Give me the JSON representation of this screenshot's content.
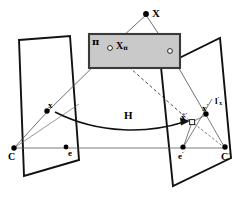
{
  "figure": {
    "background_color": "#ffffff",
    "line_color": "#000000",
    "plane_fill_color": "#c8c8c8",
    "plane_stroke_color": "#333333",
    "width": 239,
    "height": 202
  },
  "labels": {
    "scene_point": "X",
    "plane": "π",
    "plane_point": "X",
    "plane_point_sub": "π",
    "homography": "H",
    "left_image_point": "x",
    "left_camera_center": "C",
    "left_epipole": "e",
    "right_image_point": "x",
    "right_image_point_sup": "′",
    "right_transferred_point": "x̂",
    "right_transferred_point_sup": "′",
    "right_epipolar_line": "l",
    "right_epipolar_line_sup": "′",
    "right_epipolar_line_sub": "x",
    "right_camera_center": "C",
    "right_camera_center_sup": "′",
    "right_epipole": "e",
    "right_epipole_sup": "′"
  },
  "geometry": {
    "points": {
      "X": {
        "x": 146,
        "y": 14,
        "style": "filled"
      },
      "Xpi": {
        "x": 110,
        "y": 48,
        "style": "hollow"
      },
      "Xpi2": {
        "x": 170,
        "y": 51,
        "style": "hollow"
      },
      "x_left": {
        "x": 47,
        "y": 111,
        "style": "filled"
      },
      "C": {
        "x": 14,
        "y": 148,
        "style": "filled"
      },
      "e": {
        "x": 66,
        "y": 148,
        "style": "filled"
      },
      "x_right": {
        "x": 206,
        "y": 114,
        "style": "filled"
      },
      "xhat": {
        "x": 192,
        "y": 122,
        "style": "hollow"
      },
      "e_right": {
        "x": 183,
        "y": 148,
        "style": "filled"
      },
      "C_right": {
        "x": 225,
        "y": 148,
        "style": "filled"
      }
    },
    "left_plane": [
      [
        19,
        40
      ],
      [
        70,
        36
      ],
      [
        79,
        160
      ],
      [
        24,
        176
      ]
    ],
    "right_plane": [
      [
        161,
        67
      ],
      [
        220,
        38
      ],
      [
        230,
        160
      ],
      [
        173,
        186
      ]
    ],
    "pi_plane": [
      [
        89,
        36
      ],
      [
        180,
        34
      ],
      [
        180,
        68
      ],
      [
        89,
        67
      ]
    ],
    "rays": [
      {
        "from": "X",
        "to": "Xpi"
      },
      {
        "from": "X",
        "to": "Xpi2"
      },
      {
        "from": "Xpi",
        "to": "x_left",
        "via_plane": "left"
      },
      {
        "from": "Xpi",
        "to": "x_right",
        "dashed": true
      },
      {
        "from": "Xpi2",
        "to": "x_right"
      }
    ],
    "baseline": {
      "from": "C",
      "to": "C_right"
    },
    "H_arrow": {
      "start": [
        55,
        112
      ],
      "end": [
        185,
        122
      ],
      "label_at": [
        128,
        117
      ]
    }
  }
}
